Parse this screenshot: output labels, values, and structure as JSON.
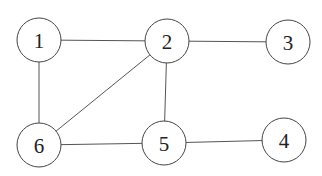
{
  "diagram": {
    "type": "undirected-graph",
    "width": 322,
    "height": 176,
    "node_radius": 22,
    "colors": {
      "edge": "#555555",
      "node_stroke": "#444444",
      "node_fill": "#ffffff",
      "label": "#222222"
    },
    "nodes": [
      {
        "id": "1",
        "label": "1",
        "x": 39,
        "y": 40
      },
      {
        "id": "2",
        "label": "2",
        "x": 167,
        "y": 41
      },
      {
        "id": "3",
        "label": "3",
        "x": 288,
        "y": 42
      },
      {
        "id": "4",
        "label": "4",
        "x": 284,
        "y": 140
      },
      {
        "id": "5",
        "label": "5",
        "x": 164,
        "y": 143
      },
      {
        "id": "6",
        "label": "6",
        "x": 39,
        "y": 145
      }
    ],
    "edges": [
      {
        "from": "1",
        "to": "2"
      },
      {
        "from": "1",
        "to": "6"
      },
      {
        "from": "2",
        "to": "3"
      },
      {
        "from": "2",
        "to": "6"
      },
      {
        "from": "2",
        "to": "5"
      },
      {
        "from": "6",
        "to": "5"
      },
      {
        "from": "5",
        "to": "4"
      }
    ]
  }
}
